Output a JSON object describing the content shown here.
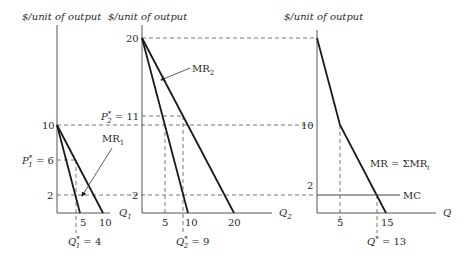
{
  "panels": [
    {
      "ylabel": "$/unit of output",
      "xlabel_main": "Q",
      "xlabel_sub": "1",
      "yticks": {
        "ten": "10",
        "two": "2"
      },
      "price_label_main": "P",
      "price_label_sup": "*",
      "price_label_sub": "1",
      "price_label_value": " = 6",
      "xticks": {
        "five": "5",
        "ten": "10"
      },
      "qstar_main": "Q",
      "qstar_sup": "*",
      "qstar_sub": "1",
      "qstar_value": " = 4",
      "mr_label_main": "MR",
      "mr_label_sub": "1"
    },
    {
      "ylabel": "$/unit of output",
      "xlabel_main": "Q",
      "xlabel_sub": "2",
      "yticks": {
        "twenty": "20",
        "two": "2"
      },
      "price_label_main": "P",
      "price_label_sup": "*",
      "price_label_sub": "2",
      "price_label_value": " = 11",
      "xticks": {
        "five": "5",
        "ten": "10",
        "twenty": "20"
      },
      "qstar_main": "Q",
      "qstar_sup": "*",
      "qstar_sub": "2",
      "qstar_value": " = 9",
      "mr_label_main": "MR",
      "mr_label_sub": "2"
    },
    {
      "ylabel": "$/unit of output",
      "xlabel_main": "Q",
      "yticks": {
        "ten": "10",
        "two": "2"
      },
      "xticks": {
        "five": "5",
        "fifteen": "15"
      },
      "qstar_main": "Q",
      "qstar_sup": "*",
      "qstar_value": " = 13",
      "mr_label": "MR = ΣMR",
      "mr_label_sub": "i",
      "mc_label": "MC"
    }
  ]
}
